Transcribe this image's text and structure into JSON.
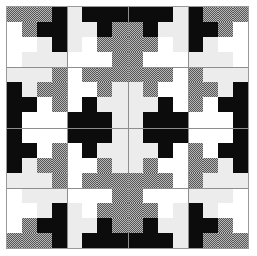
{
  "title": "",
  "legend": {
    "K": {
      "name": "black",
      "color": "#0c0c0c"
    },
    "W": {
      "name": "white",
      "color": "#ffffff"
    },
    "L": {
      "name": "light-gray",
      "color": "#ececec"
    },
    "D": {
      "name": "dotted-gray",
      "color": "#8a8a8a"
    }
  },
  "grid": {
    "cols": 16,
    "rows": 16,
    "block_size": 4,
    "cells": [
      "DDDKLKKKKKKLKDDD",
      "WDKKLLKDDKLLKKDW",
      "WWLKLWDDDDWLKLWW",
      "WLLLWWWDDWWWLLLW",
      "LLLDWDDDDDDWDLLL",
      "KLDDWWDLLDWWDDLK",
      "KKWDWKLLLLKWDWKK",
      "KWWWKKKLLKKKWWWK",
      "KWWWKKKLLKKKWWWK",
      "KKWDWKLLLLKWDWKK",
      "KLDDWWDLLDWWDDLK",
      "LLLDWDDDDDDWDLLL",
      "WLLLWWWDDWWWLLLW",
      "WWLKLWDDDDWLKLWW",
      "WDKKLLKDDKLLKKDW",
      "DDDKLKKKKKKLKDDD"
    ]
  }
}
